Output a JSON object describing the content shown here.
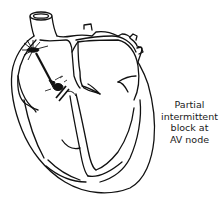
{
  "diagram": {
    "parts": [
      "aorta",
      "right-atrium",
      "left-atrium",
      "right-ventricle",
      "left-ventricle",
      "interventricular-septum",
      "SA-node",
      "AV-node",
      "bundle-branches"
    ],
    "annotation": {
      "lines": [
        "Partial",
        "intermittent",
        "block at",
        "AV node"
      ]
    },
    "colors": {
      "stroke": "#111111",
      "background": "#ffffff"
    }
  }
}
